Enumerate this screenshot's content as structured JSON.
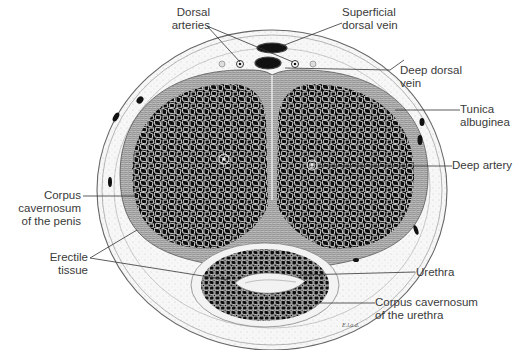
{
  "figure": {
    "signature": "E.l.a.d."
  },
  "labels": {
    "dorsal_arteries": [
      "Dorsal",
      "arteries"
    ],
    "superficial_dorsal_vein": [
      "Superficial",
      "dorsal vein"
    ],
    "deep_dorsal_vein": [
      "Deep dorsal",
      "vein"
    ],
    "tunica_albuginea": [
      "Tunica",
      "albuginea"
    ],
    "deep_artery": [
      "Deep artery"
    ],
    "corpus_cavernosum_penis": [
      "Corpus",
      "cavernosum",
      "of the penis"
    ],
    "erectile_tissue": [
      "Erectile",
      "tissue"
    ],
    "urethra": [
      "Urethra"
    ],
    "corpus_cavernosum_urethra": [
      "Corpus cavernosum",
      "of the urethra"
    ]
  },
  "colors": {
    "tissue_dark": "#0d0d0d",
    "trabeculae": "#e8e8e8",
    "outline": "#555555",
    "label_text": "#3a3a3a",
    "leader_line": "#333333"
  }
}
